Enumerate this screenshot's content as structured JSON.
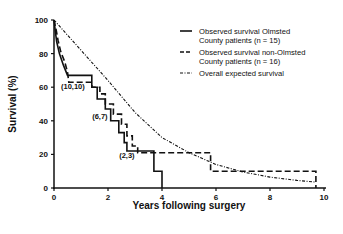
{
  "chart_data": {
    "type": "line",
    "title": "",
    "xlabel": "Years following surgery",
    "ylabel": "Survival (%)",
    "xlim": [
      0,
      10
    ],
    "ylim": [
      0,
      100
    ],
    "x_ticks": [
      0,
      2,
      4,
      6,
      8,
      10
    ],
    "y_ticks": [
      0,
      20,
      40,
      60,
      80,
      100
    ],
    "grid": false,
    "legend_position": "upper right",
    "series": [
      {
        "name": "Observed survival Olmsted County patients (n = 15)",
        "legend_lines": [
          "Observed survival Olmsted",
          "County patients (n = 15)"
        ],
        "style": "solid",
        "step": true,
        "points": [
          [
            0,
            100
          ],
          [
            0.05,
            93
          ],
          [
            0.1,
            87
          ],
          [
            0.2,
            80
          ],
          [
            0.35,
            73
          ],
          [
            0.5,
            67
          ],
          [
            1.4,
            67
          ],
          [
            1.4,
            60
          ],
          [
            1.6,
            60
          ],
          [
            1.6,
            53
          ],
          [
            1.9,
            53
          ],
          [
            1.9,
            47
          ],
          [
            2.1,
            47
          ],
          [
            2.1,
            40
          ],
          [
            2.4,
            40
          ],
          [
            2.4,
            33
          ],
          [
            2.6,
            33
          ],
          [
            2.6,
            27
          ],
          [
            2.7,
            27
          ],
          [
            2.7,
            22
          ],
          [
            3.7,
            22
          ],
          [
            3.7,
            10
          ],
          [
            4.0,
            10
          ],
          [
            4.0,
            0
          ]
        ]
      },
      {
        "name": "Observed survival non-Olmsted County patients (n = 16)",
        "legend_lines": [
          "Observed survival non-Olmsted",
          "County patients (n = 16)"
        ],
        "style": "dashed",
        "step": true,
        "points": [
          [
            0,
            100
          ],
          [
            0.08,
            94
          ],
          [
            0.15,
            88
          ],
          [
            0.25,
            81
          ],
          [
            0.4,
            75
          ],
          [
            0.5,
            69
          ],
          [
            0.55,
            63
          ],
          [
            1.4,
            63
          ],
          [
            1.4,
            60
          ],
          [
            1.7,
            60
          ],
          [
            1.7,
            56
          ],
          [
            1.9,
            56
          ],
          [
            1.9,
            50
          ],
          [
            2.2,
            50
          ],
          [
            2.2,
            44
          ],
          [
            2.5,
            44
          ],
          [
            2.5,
            38
          ],
          [
            2.7,
            38
          ],
          [
            2.7,
            31
          ],
          [
            2.9,
            31
          ],
          [
            2.9,
            25
          ],
          [
            3.1,
            25
          ],
          [
            3.1,
            21
          ],
          [
            5.8,
            21
          ],
          [
            5.8,
            10
          ],
          [
            9.7,
            10
          ],
          [
            9.7,
            0
          ]
        ]
      },
      {
        "name": "Overall expected survival",
        "legend_lines": [
          "Overall expected survival"
        ],
        "style": "dash-dot",
        "step": false,
        "points": [
          [
            0,
            100
          ],
          [
            1,
            82
          ],
          [
            2,
            64
          ],
          [
            3,
            45
          ],
          [
            4,
            30
          ],
          [
            5,
            21
          ],
          [
            6,
            14
          ],
          [
            7,
            9.5
          ],
          [
            8,
            6.5
          ],
          [
            9,
            4.5
          ],
          [
            9.7,
            3.5
          ]
        ]
      }
    ],
    "annotations": [
      {
        "text": "(10,10)",
        "x": 0.7,
        "y": 59
      },
      {
        "text": "(6,7)",
        "x": 1.7,
        "y": 41
      },
      {
        "text": "(2,3)",
        "x": 2.7,
        "y": 18
      }
    ]
  }
}
